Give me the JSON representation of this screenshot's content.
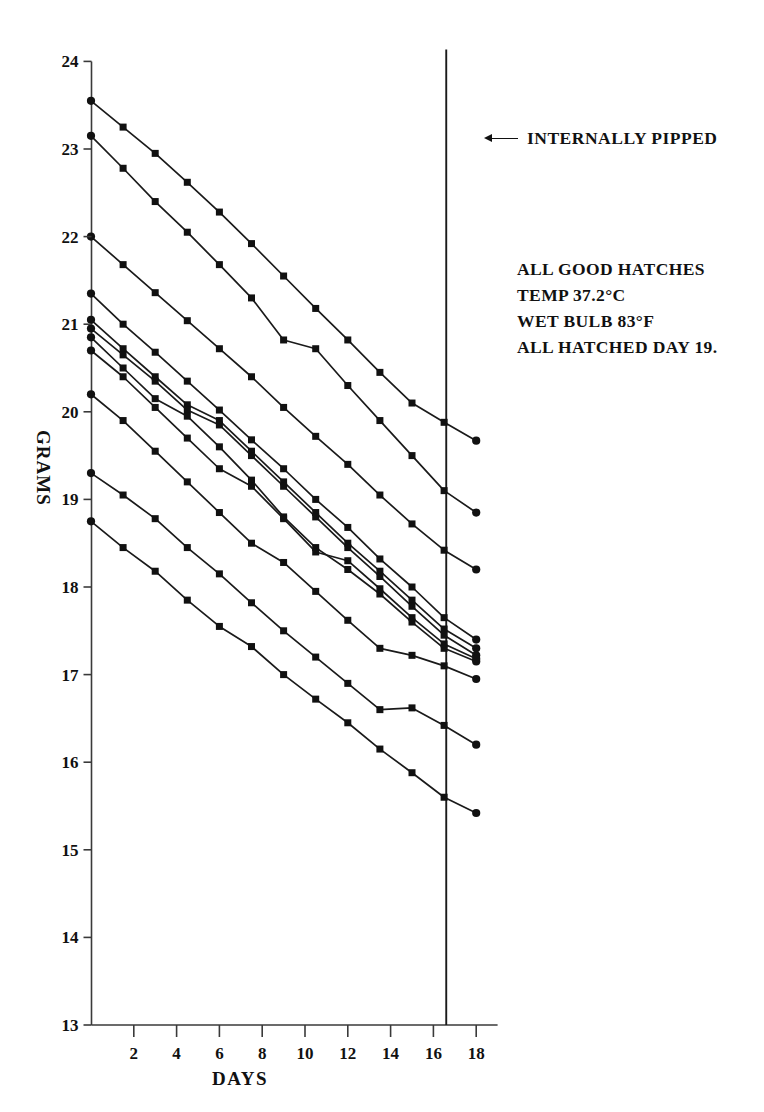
{
  "chart_data": {
    "type": "line",
    "title": "",
    "xlabel": "DAYS",
    "ylabel": "GRAMS",
    "xlim": [
      0,
      19
    ],
    "ylim": [
      13,
      24
    ],
    "xticks": [
      2,
      4,
      6,
      8,
      10,
      12,
      14,
      16,
      18
    ],
    "yticks": [
      13,
      14,
      15,
      16,
      17,
      18,
      19,
      20,
      21,
      22,
      23,
      24
    ],
    "grid": false,
    "legend": "none",
    "x": [
      0,
      1.5,
      3,
      4.5,
      6,
      7.5,
      9,
      10.5,
      12,
      13.5,
      15,
      16.5,
      18
    ],
    "series": [
      {
        "name": "egg-1",
        "values": [
          23.55,
          23.25,
          22.95,
          22.62,
          22.28,
          21.92,
          21.55,
          21.18,
          20.82,
          20.45,
          20.1,
          19.88,
          19.67
        ]
      },
      {
        "name": "egg-2",
        "values": [
          23.15,
          22.78,
          22.4,
          22.05,
          21.68,
          21.3,
          20.82,
          20.72,
          20.3,
          19.9,
          19.5,
          19.1,
          18.85
        ]
      },
      {
        "name": "egg-3",
        "values": [
          22.0,
          21.68,
          21.36,
          21.04,
          20.72,
          20.4,
          20.05,
          19.72,
          19.4,
          19.05,
          18.72,
          18.42,
          18.2
        ]
      },
      {
        "name": "egg-4",
        "values": [
          21.35,
          21.0,
          20.68,
          20.35,
          20.02,
          19.68,
          19.35,
          19.0,
          18.68,
          18.32,
          18.0,
          17.65,
          17.4
        ]
      },
      {
        "name": "egg-5",
        "values": [
          21.05,
          20.72,
          20.4,
          20.08,
          19.9,
          19.55,
          19.2,
          18.85,
          18.5,
          18.18,
          17.85,
          17.52,
          17.3
        ]
      },
      {
        "name": "egg-6",
        "values": [
          20.95,
          20.65,
          20.35,
          20.02,
          19.85,
          19.5,
          19.15,
          18.8,
          18.45,
          18.12,
          17.78,
          17.45,
          17.22
        ]
      },
      {
        "name": "egg-7",
        "values": [
          20.85,
          20.5,
          20.15,
          19.95,
          19.6,
          19.22,
          18.8,
          18.45,
          18.2,
          17.92,
          17.6,
          17.3,
          17.15
        ]
      },
      {
        "name": "egg-8",
        "values": [
          20.7,
          20.4,
          20.05,
          19.7,
          19.35,
          19.15,
          18.78,
          18.4,
          18.3,
          17.98,
          17.65,
          17.35,
          17.18
        ]
      },
      {
        "name": "egg-9",
        "values": [
          20.2,
          19.9,
          19.55,
          19.2,
          18.85,
          18.5,
          18.28,
          17.95,
          17.62,
          17.3,
          17.22,
          17.1,
          16.95
        ]
      },
      {
        "name": "egg-10",
        "values": [
          19.3,
          19.05,
          18.78,
          18.45,
          18.15,
          17.82,
          17.5,
          17.2,
          16.9,
          16.6,
          16.62,
          16.42,
          16.2
        ]
      },
      {
        "name": "egg-11",
        "values": [
          18.75,
          18.45,
          18.18,
          17.85,
          17.55,
          17.32,
          17.0,
          16.72,
          16.45,
          16.15,
          15.88,
          15.6,
          15.42
        ]
      }
    ],
    "annotations": {
      "pipped_label": "INTERNALLY PIPPED",
      "pipped_day": 16.6,
      "notes": [
        "ALL GOOD HATCHES",
        "TEMP 37.2°C",
        "WET BULB 83°F",
        "ALL HATCHED DAY 19."
      ]
    },
    "colors": {
      "line": "#1a1a1a",
      "axis": "#3a3a3a",
      "marker": "#111111",
      "background": "#ffffff"
    }
  }
}
